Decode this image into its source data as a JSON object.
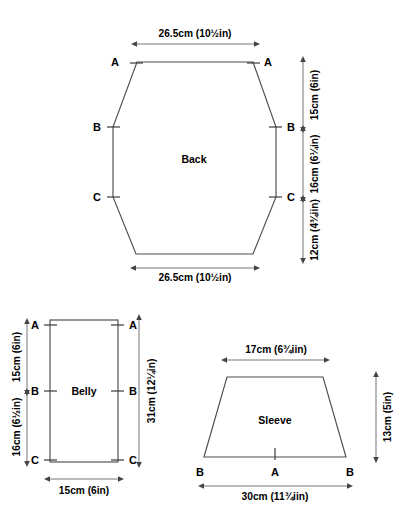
{
  "diagram": {
    "pieces": [
      {
        "id": "back",
        "name": "Back",
        "shape": "hexagon",
        "dimensions": {
          "top_width": "26.5cm (10½in)",
          "bottom_width": "26.5cm (10½in)",
          "right_seg_top": "15cm (6in)",
          "right_seg_mid": "16cm (6¼in)",
          "right_seg_bottom": "12cm (4¾:in)"
        },
        "points": [
          "A",
          "A",
          "B",
          "B",
          "C",
          "C"
        ]
      },
      {
        "id": "belly",
        "name": "Belly",
        "shape": "rectangle",
        "dimensions": {
          "bottom_width": "15cm (6in)",
          "left_seg_top": "15cm (6in)",
          "left_seg_bottom": "16cm (6½in)",
          "right_total": "31cm (12¼in)"
        },
        "points": [
          "A",
          "A",
          "B",
          "B",
          "C",
          "C"
        ]
      },
      {
        "id": "sleeve",
        "name": "Sleeve",
        "shape": "trapezoid",
        "dimensions": {
          "top_width": "17cm (6¾iin)",
          "bottom_width": "30cm (11¾iin)",
          "right_height": "13cm (5in)"
        },
        "points": [
          "B",
          "A",
          "B"
        ]
      }
    ],
    "labels": {
      "back": "Back",
      "belly": "Belly",
      "sleeve": "Sleeve",
      "point_a": "A",
      "point_b": "B",
      "point_c": "C"
    },
    "measurements": {
      "back_top": "26.5cm (10½in)",
      "back_bottom": "26.5cm (10½in)",
      "back_right_1": "15cm (6in)",
      "back_right_2": "16cm (6¼in)",
      "back_right_3": "12cm (4¾iin)",
      "belly_left_1": "15cm (6in)",
      "belly_left_2": "16cm (6½in)",
      "belly_right": "31cm (12¼in)",
      "belly_bottom": "15cm (6in)",
      "sleeve_top": "17cm (6¾iin)",
      "sleeve_bottom": "30cm (11¾iin)",
      "sleeve_right": "13cm (5in)"
    },
    "colors": {
      "outline": "#4d4d4d",
      "dimension": "#666666",
      "text": "#000000",
      "background": "#ffffff"
    }
  }
}
